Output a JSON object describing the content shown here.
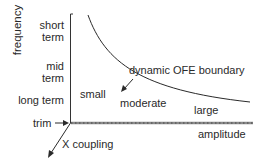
{
  "diagram": {
    "y_axis_label": "frequency",
    "y_levels": [
      "short term",
      "mid term",
      "long term"
    ],
    "y_levels_lines": [
      [
        "short",
        "term"
      ],
      [
        "mid",
        "term"
      ],
      [
        "long term"
      ]
    ],
    "origin_label": "trim",
    "x_axis_label": "amplitude",
    "depth_axis_label": "X coupling",
    "boundary_label": "dynamic OFE boundary",
    "regions": [
      "small",
      "moderate",
      "large"
    ],
    "colors": {
      "line": "#2a2a2a",
      "axis_x": "#6a6a6a"
    }
  }
}
